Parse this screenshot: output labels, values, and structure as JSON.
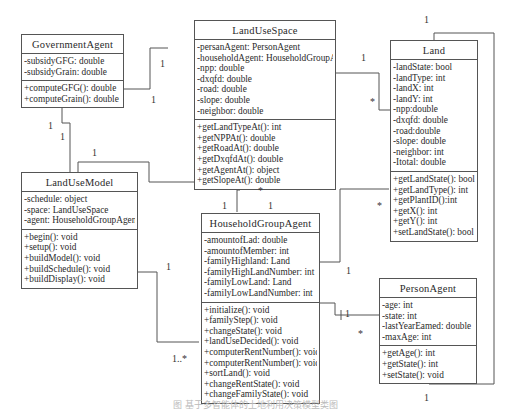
{
  "diagram": {
    "type": "UML class diagram",
    "classes": {
      "government_agent": {
        "name": "GovernmentAgent",
        "attributes": [
          "-subsidyGFG: double",
          "-subsidyGrain: double"
        ],
        "operations": [
          "+computeGFG(): double",
          "+computeGrain(): double"
        ]
      },
      "land_use_space": {
        "name": "LandUseSpace",
        "attributes": [
          "-persanAgent: PersonAgent",
          "-householdAgent: HouseholdGroupAgent",
          "-npp: double",
          "-dxqfd: double",
          "-road: double",
          "-slope: double",
          "-neighbor: double"
        ],
        "operations": [
          "+getLandTypeAt(): int",
          "+getNPPAt(): double",
          "+getRoadAt(): double",
          "+getDxqfdAt(): double",
          "+getAgentAt(): object",
          "+getSlopeAt(): double"
        ]
      },
      "land": {
        "name": "Land",
        "attributes": [
          "-landState: bool",
          "-landType: int",
          "-landX: int",
          "-landY: int",
          "-npp:double",
          "-dxqfd: double",
          "-road:double",
          "-slope: double",
          "-neighbor: int",
          "-Itotal: double"
        ],
        "operations": [
          "+getLandState(): bool",
          "+getLandType(): int",
          "+getPlantID():int",
          "+getX(): int",
          "+getY(): int",
          "+setLandState(): bool"
        ]
      },
      "land_use_model": {
        "name": "LandUseModel",
        "attributes": [
          "-schedule: object",
          "-space: LandUseSpace",
          "-agent: HouseholdGroupAgent"
        ],
        "operations": [
          "+begin(): void",
          "+setup(): void",
          "+buildModel(): void",
          "+buildSchedule(): void",
          "+buildDisplay(): void"
        ]
      },
      "household_group_agent": {
        "name": "HouseholdGroupAgent",
        "attributes": [
          "-amountofLad: double",
          "-amountofMember: int",
          "-familyHighland: Land",
          "-familyHighLandNumber: int",
          "-familyLowLand: Land",
          "-familyLowLandNumber: int"
        ],
        "operations": [
          "+initialize(): void",
          "+familyStep(): void",
          "+changeState(): void",
          "+landUseDecided(): void",
          "+computerRentNumber(): void",
          "+computerRentNumber(): void",
          "+sortLand(): void",
          "+changeRentState(): void",
          "+changeFamilyState(): void"
        ]
      },
      "person_agent": {
        "name": "PersonAgent",
        "attributes": [
          "-age: int",
          "-state: int",
          "-lastYearEamed: double",
          "-maxAge: int"
        ],
        "operations": [
          "+getAge(): int",
          "+getState(): int",
          "+setState(): void"
        ]
      }
    },
    "multiplicities": {
      "gov_space_a": "1",
      "gov_space_b": "1",
      "gov_model_a": "1",
      "gov_model_b": "1",
      "model_space": "1",
      "space_land_a": "1",
      "space_land_b": "*",
      "land_self": "1",
      "space_hga_a": "*",
      "space_hga_b": "1",
      "model_hga_top": "1",
      "model_hga_a": "1",
      "model_hga_b": "1..*",
      "land_hga": "*",
      "hga_person_a": "1",
      "hga_person_b": "1",
      "hga_person_c": "*",
      "person_land": "1"
    },
    "caption": "图 基于多智能体的土地利用决策模型类图"
  }
}
